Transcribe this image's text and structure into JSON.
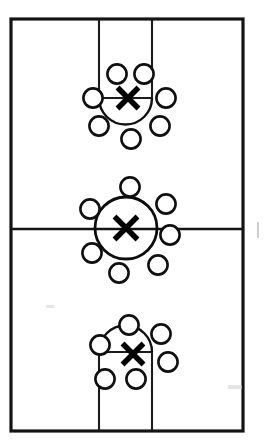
{
  "diagram": {
    "type": "basketball-court-full",
    "background_color": "#ffffff",
    "line_color": "#141414",
    "marker_fill": "#ffffff",
    "marker_stroke": "#101010",
    "x_marker_color": "#000000",
    "court": {
      "left": 11,
      "top": 19,
      "right": 243,
      "bottom": 431,
      "outline_width": 3.2,
      "halfcourt_y": 229,
      "lane_left_x": 99,
      "lane_right_x": 152
    },
    "labels": {
      "court_outline": "Court Boundary",
      "halfcourt": "Half Court Line",
      "top_key": "Top Key / Free Throw Lane",
      "bottom_key": "Bottom Key / Free Throw Lane",
      "center_circle": "Center Circle",
      "top_arc": "Top Free Throw Arc",
      "bottom_arc": "Bottom Free Throw Arc",
      "x_marker": "X",
      "player_marker": "O"
    },
    "groups": [
      {
        "name": "top-group",
        "x_marker": {
          "cx": 128,
          "cy": 98,
          "size": 21
        },
        "free_throw_line_y": 98,
        "arc": {
          "cx": 125.5,
          "cy": 98,
          "r": 26.5,
          "orientation": "down"
        },
        "markers": [
          {
            "id": "top-o-1",
            "cx": 117,
            "cy": 74,
            "r": 9.6
          },
          {
            "id": "top-o-2",
            "cx": 144,
            "cy": 74,
            "r": 9.6
          },
          {
            "id": "top-o-3",
            "cx": 93,
            "cy": 98,
            "r": 9.6
          },
          {
            "id": "top-o-4",
            "cx": 166,
            "cy": 98,
            "r": 9.6
          },
          {
            "id": "top-o-5",
            "cx": 99,
            "cy": 126,
            "r": 9.6
          },
          {
            "id": "top-o-6",
            "cx": 160,
            "cy": 126,
            "r": 9.6
          },
          {
            "id": "top-o-7",
            "cx": 131,
            "cy": 139,
            "r": 9.6
          }
        ]
      },
      {
        "name": "center-group",
        "x_marker": {
          "cx": 126,
          "cy": 228,
          "size": 23
        },
        "center_circle": {
          "cx": 126,
          "cy": 228,
          "r": 31
        },
        "markers": [
          {
            "id": "mid-o-1",
            "cx": 130,
            "cy": 187,
            "r": 9.6
          },
          {
            "id": "mid-o-2",
            "cx": 166,
            "cy": 204,
            "r": 9.6
          },
          {
            "id": "mid-o-3",
            "cx": 90,
            "cy": 209,
            "r": 9.6
          },
          {
            "id": "mid-o-4",
            "cx": 170,
            "cy": 235,
            "r": 9.6
          },
          {
            "id": "mid-o-5",
            "cx": 92,
            "cy": 253,
            "r": 9.6
          },
          {
            "id": "mid-o-6",
            "cx": 158,
            "cy": 265,
            "r": 9.6
          },
          {
            "id": "mid-o-7",
            "cx": 119,
            "cy": 273,
            "r": 9.6
          }
        ]
      },
      {
        "name": "bottom-group",
        "x_marker": {
          "cx": 133,
          "cy": 354,
          "size": 21
        },
        "free_throw_line_y": 352,
        "arc": {
          "cx": 125.5,
          "cy": 352,
          "r": 26.5,
          "orientation": "up"
        },
        "markers": [
          {
            "id": "bot-o-1",
            "cx": 129,
            "cy": 325,
            "r": 9.6
          },
          {
            "id": "bot-o-2",
            "cx": 161,
            "cy": 334,
            "r": 9.6
          },
          {
            "id": "bot-o-3",
            "cx": 100,
            "cy": 345,
            "r": 9.6
          },
          {
            "id": "bot-o-4",
            "cx": 168,
            "cy": 362,
            "r": 9.6
          },
          {
            "id": "bot-o-5",
            "cx": 105,
            "cy": 379,
            "r": 9.6
          },
          {
            "id": "bot-o-6",
            "cx": 136,
            "cy": 379,
            "r": 9.6
          }
        ]
      }
    ]
  }
}
